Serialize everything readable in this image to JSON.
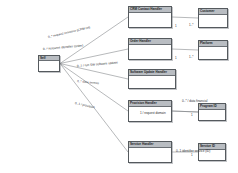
{
  "diagram": {
    "type": "class-diagram",
    "canvas": {
      "width": 238,
      "height": 173
    },
    "background_color": "#ffffff",
    "node_border_color": "#555a5e",
    "node_header_color": "#b9bdc2",
    "edge_color": "#6e7276"
  },
  "nodes": [
    {
      "id": "root",
      "label": "Self",
      "x": 38,
      "y": 55,
      "w": 22,
      "h": 17
    },
    {
      "id": "crm",
      "label": "CRM Contact Handler",
      "x": 128,
      "y": 6,
      "w": 44,
      "h": 22
    },
    {
      "id": "customer",
      "label": "Customer",
      "x": 198,
      "y": 8,
      "w": 30,
      "h": 20
    },
    {
      "id": "orders",
      "label": "Order Handler",
      "x": 128,
      "y": 38,
      "w": 44,
      "h": 22
    },
    {
      "id": "platform",
      "label": "Platform",
      "x": 198,
      "y": 40,
      "w": 30,
      "h": 20
    },
    {
      "id": "software",
      "label": "Software Update Handler",
      "x": 128,
      "y": 69,
      "w": 48,
      "h": 20
    },
    {
      "id": "provision",
      "label": "Provision Handler",
      "x": 128,
      "y": 100,
      "w": 44,
      "h": 22
    },
    {
      "id": "programid",
      "label": "Program ID",
      "x": 198,
      "y": 103,
      "w": 28,
      "h": 18
    },
    {
      "id": "service",
      "label": "Service Handler",
      "x": 128,
      "y": 141,
      "w": 44,
      "h": 22
    },
    {
      "id": "serviceid",
      "label": "Service ID",
      "x": 198,
      "y": 143,
      "w": 28,
      "h": 18
    }
  ],
  "edges": [
    {
      "id": "e-root-crm",
      "from": "root",
      "to": "crm",
      "label": "0..* request resource (CRM ref)",
      "label_x": 48,
      "label_y": 35,
      "label_rot": -13
    },
    {
      "id": "e-root-orders",
      "from": "root",
      "to": "orders",
      "label": "0..* resource identifier (order)",
      "label_x": 43,
      "label_y": 47,
      "label_rot": -5
    },
    {
      "id": "e-root-software",
      "from": "root",
      "to": "software",
      "label": "0..1 / run SW software update",
      "label_x": 77,
      "label_y": 64,
      "label_rot": -5
    },
    {
      "id": "e-root-provision",
      "from": "root",
      "to": "provision",
      "label": "0..* data access",
      "label_x": 77,
      "label_y": 79,
      "label_rot": 6
    },
    {
      "id": "e-root-service",
      "from": "root",
      "to": "service",
      "label": "0..1 / provision",
      "label_x": 75,
      "label_y": 101,
      "label_rot": 13
    },
    {
      "id": "e-crm-customer",
      "from": "crm",
      "to": "customer",
      "label": "",
      "label_x": 0,
      "label_y": 0,
      "label_rot": 0
    },
    {
      "id": "e-orders-platform",
      "from": "orders",
      "to": "platform",
      "label": "",
      "label_x": 0,
      "label_y": 0,
      "label_rot": 0
    },
    {
      "id": "e-provision-programid",
      "from": "provision",
      "to": "programid",
      "label": "1 / request domain",
      "label_x": 140,
      "label_y": 111,
      "label_rot": 0
    },
    {
      "id": "e-service-serviceid",
      "from": "service",
      "to": "serviceid",
      "label": "0..1 identifier service (ID)",
      "label_x": 176,
      "label_y": 149,
      "label_rot": 0
    },
    {
      "id": "e-provision-upper",
      "from": "provision",
      "to": "programid",
      "label": "0..*  / data financial",
      "label_x": 182,
      "label_y": 99,
      "label_rot": 0
    }
  ],
  "cardinalities": [
    {
      "id": "c-crm-right",
      "text": "1",
      "x": 175,
      "y": 24
    },
    {
      "id": "c-customer-left",
      "text": "1..*",
      "x": 189,
      "y": 23
    },
    {
      "id": "c-orders-right",
      "text": "1",
      "x": 175,
      "y": 56
    },
    {
      "id": "c-platform-left",
      "text": "1..*",
      "x": 189,
      "y": 55
    },
    {
      "id": "c-programid-left",
      "text": "1",
      "x": 191,
      "y": 113
    },
    {
      "id": "c-serviceid-left",
      "text": "1",
      "x": 191,
      "y": 153
    }
  ]
}
